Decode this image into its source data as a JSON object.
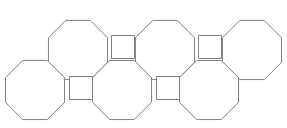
{
  "figure": {
    "name": "truncated-square-tiling-fragment",
    "canvas": {
      "width": 287,
      "height": 128
    },
    "style": {
      "background_color": "#ffffff",
      "stroke_color": "#808080",
      "fill_color": "#ffffff",
      "stroke_width": 1
    },
    "geometry": {
      "octagon_circumradius": 32,
      "octagon_width": 59,
      "square_side": 23,
      "upper_row_center_y": 50,
      "lower_row_center_y": 90,
      "row_spacing_x": 87
    },
    "octagons": [
      {
        "id": "octagon-upper-1",
        "row": "upper",
        "index": 1,
        "cx": 78,
        "cy": 50,
        "r": 32,
        "clipped": false
      },
      {
        "id": "octagon-upper-2",
        "row": "upper",
        "index": 2,
        "cx": 165,
        "cy": 50,
        "r": 32,
        "clipped": false
      },
      {
        "id": "octagon-upper-3",
        "row": "upper",
        "index": 3,
        "cx": 252,
        "cy": 50,
        "r": 32,
        "clipped": true
      },
      {
        "id": "octagon-lower-1",
        "row": "lower",
        "index": 1,
        "cx": 35,
        "cy": 90,
        "r": 32,
        "clipped": true
      },
      {
        "id": "octagon-lower-2",
        "row": "lower",
        "index": 2,
        "cx": 122,
        "cy": 90,
        "r": 32,
        "clipped": false
      },
      {
        "id": "octagon-lower-3",
        "row": "lower",
        "index": 3,
        "cx": 209,
        "cy": 90,
        "r": 32,
        "clipped": false
      }
    ],
    "squares": [
      {
        "id": "square-upper-1",
        "row": "upper",
        "index": 1,
        "cx": 123,
        "cy": 47,
        "side": 23
      },
      {
        "id": "square-upper-2",
        "row": "upper",
        "index": 2,
        "cx": 210,
        "cy": 47,
        "side": 23
      },
      {
        "id": "square-lower-1",
        "row": "lower",
        "index": 1,
        "cx": 81,
        "cy": 88,
        "side": 23
      },
      {
        "id": "square-lower-2",
        "row": "lower",
        "index": 2,
        "cx": 168,
        "cy": 88,
        "side": 23
      }
    ],
    "counts": {
      "octagons_visible": 6,
      "squares_visible": 4,
      "rows": 2
    }
  }
}
